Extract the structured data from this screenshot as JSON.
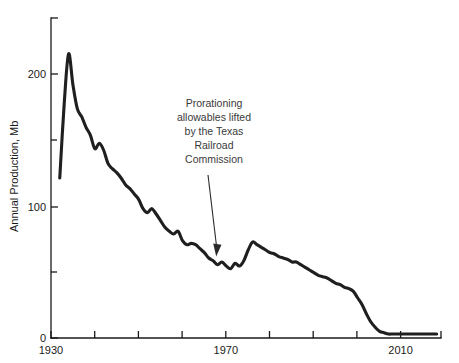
{
  "chart_data": {
    "type": "line",
    "title": "",
    "subtitle": "",
    "xlabel": "",
    "ylabel": "Annual Production, Mb",
    "xlim": [
      1928,
      2017
    ],
    "ylim": [
      0,
      240
    ],
    "grid": false,
    "legend": null,
    "x_ticks_major": [
      1930,
      1970,
      2010
    ],
    "x_tick_labels": [
      "1930",
      "1970",
      "2010"
    ],
    "x_ticks_minor": [
      1940,
      1950,
      1960,
      1980,
      1990,
      2000
    ],
    "y_ticks_major": [
      0,
      100,
      200
    ],
    "y_tick_labels": [
      "0",
      "100",
      "200"
    ],
    "y_ticks_minor": [
      50,
      150
    ],
    "series": [
      {
        "name": "Annual Production",
        "color": "#1f1f1f",
        "x": [
          1930,
          1931,
          1932,
          1933,
          1934,
          1935,
          1936,
          1937,
          1938,
          1939,
          1940,
          1941,
          1942,
          1943,
          1944,
          1945,
          1946,
          1947,
          1948,
          1949,
          1950,
          1951,
          1952,
          1953,
          1954,
          1955,
          1956,
          1957,
          1958,
          1959,
          1960,
          1961,
          1962,
          1963,
          1964,
          1965,
          1966,
          1967,
          1968,
          1969,
          1970,
          1971,
          1972,
          1973,
          1974,
          1975,
          1976,
          1977,
          1978,
          1979,
          1980,
          1981,
          1982,
          1983,
          1984,
          1985,
          1986,
          1987,
          1988,
          1989,
          1990,
          1991,
          1992,
          1993,
          1994,
          1995,
          1996,
          1997,
          1998,
          1999,
          2000,
          2001,
          2002,
          2003,
          2004,
          2005,
          2006,
          2007,
          2008,
          2009,
          2010,
          2011,
          2012,
          2013,
          2014,
          2015,
          2016
        ],
        "y": [
          120,
          175,
          213,
          190,
          172,
          166,
          158,
          152,
          142,
          146,
          141,
          131,
          127,
          124,
          120,
          115,
          112,
          108,
          104,
          97,
          94,
          97,
          93,
          88,
          83,
          80,
          78,
          80,
          73,
          70,
          71,
          70,
          67,
          64,
          60,
          58,
          55,
          57,
          54,
          52,
          56,
          54,
          58,
          66,
          72,
          70,
          68,
          66,
          64,
          63,
          61,
          60,
          59,
          57,
          57,
          55,
          53,
          51,
          49,
          47,
          46,
          45,
          43,
          41,
          40,
          38,
          37,
          35,
          30,
          25,
          18,
          12,
          8,
          5,
          4,
          3,
          3,
          3,
          3,
          3,
          3,
          3,
          3,
          3,
          3,
          3,
          3
        ]
      }
    ],
    "annotations": [
      {
        "id": "prorationing-note",
        "lines": [
          "Prorationing",
          "allowables lifted",
          "by the Texas",
          "Railroad",
          "Commission"
        ],
        "text": "Prorationing allowables lifted by the Texas Railroad Commission",
        "arrow_from_x": 1969,
        "arrow_from_y": 118,
        "arrow_to_x": 1971,
        "arrow_to_y": 63
      }
    ]
  },
  "axes": {
    "y_title": "Annual Production, Mb"
  }
}
